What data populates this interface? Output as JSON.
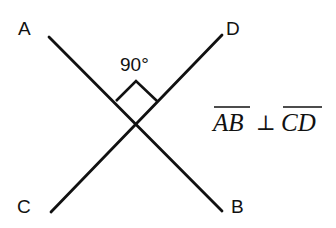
{
  "diagram": {
    "type": "perpendicular-lines",
    "points": {
      "A": {
        "label": "A"
      },
      "B": {
        "label": "B"
      },
      "C": {
        "label": "C"
      },
      "D": {
        "label": "D"
      }
    },
    "segments": [
      {
        "name": "AB",
        "from": "A",
        "to": "B"
      },
      {
        "name": "CD",
        "from": "C",
        "to": "D"
      }
    ],
    "angle": {
      "label": "90°",
      "type": "right-angle"
    },
    "notation": {
      "left_segment": "AB",
      "symbol": "⊥",
      "right_segment": "CD"
    }
  }
}
